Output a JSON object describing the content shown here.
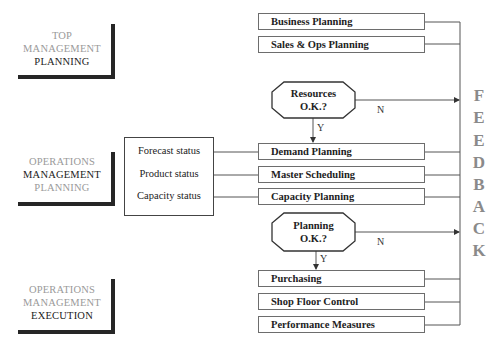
{
  "levels": [
    {
      "id": "top-management-planning",
      "lines": [
        {
          "text": "TOP",
          "tone": "light"
        },
        {
          "text": "MANAGEMENT",
          "tone": "light"
        },
        {
          "text": "PLANNING",
          "tone": "dark"
        }
      ]
    },
    {
      "id": "operations-management-planning",
      "lines": [
        {
          "text": "OPERATIONS",
          "tone": "light"
        },
        {
          "text": "MANAGEMENT",
          "tone": "dark"
        },
        {
          "text": "PLANNING",
          "tone": "light"
        }
      ]
    },
    {
      "id": "operations-management-execution",
      "lines": [
        {
          "text": "OPERATIONS",
          "tone": "light"
        },
        {
          "text": "MANAGEMENT",
          "tone": "light"
        },
        {
          "text": "EXECUTION",
          "tone": "dark"
        }
      ]
    }
  ],
  "status_box": {
    "items": [
      "Forecast status",
      "Product status",
      "Capacity status"
    ]
  },
  "process_boxes": [
    "Business Planning",
    "Sales & Ops Planning",
    "Demand Planning",
    "Master Scheduling",
    "Capacity Planning",
    "Purchasing",
    "Shop Floor Control",
    "Performance Measures"
  ],
  "decisions": [
    {
      "line1": "Resources",
      "line2": "O.K.?",
      "yes_label": "Y",
      "no_label": "N"
    },
    {
      "line1": "Planning",
      "line2": "O.K.?",
      "yes_label": "Y",
      "no_label": "N"
    }
  ],
  "feedback": {
    "letters": [
      "F",
      "E",
      "E",
      "D",
      "B",
      "A",
      "C",
      "K"
    ]
  },
  "colors": {
    "line": "#555555",
    "bracket": "#262626",
    "feedback_text": "#8a8a8a",
    "light_label": "#9a9a9a",
    "dark_label": "#222222"
  }
}
